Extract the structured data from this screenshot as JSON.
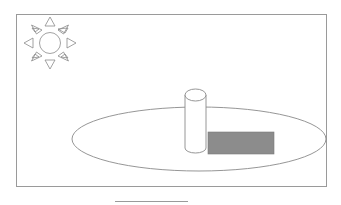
{
  "diagram": {
    "title": "",
    "colors": {
      "stroke": "#8a8a8a",
      "shadow_fill": "#8c8c8c",
      "background": "#ffffff"
    },
    "elements": [
      {
        "type": "frame",
        "label": "scene border"
      },
      {
        "type": "sun",
        "label": "sun",
        "rays": 8
      },
      {
        "type": "ellipse",
        "label": "ground plane"
      },
      {
        "type": "cylinder",
        "label": "pole / gnomon"
      },
      {
        "type": "rectangle",
        "label": "shadow"
      },
      {
        "type": "line",
        "label": "underline"
      }
    ]
  }
}
